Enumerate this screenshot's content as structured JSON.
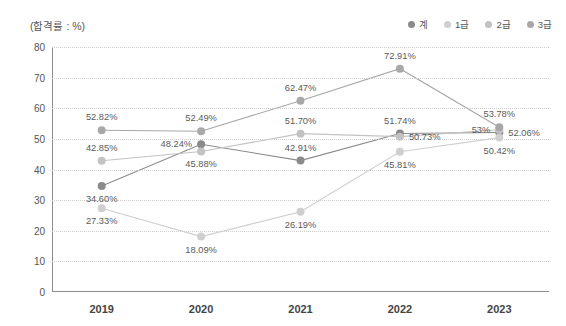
{
  "unit_label": "(합격률 : %)",
  "legend": {
    "position": "top-right",
    "items": [
      {
        "label": "계",
        "color": "#8a8a8a"
      },
      {
        "label": "1급",
        "color": "#cfcfcf"
      },
      {
        "label": "2급",
        "color": "#c2c2c2"
      },
      {
        "label": "3급",
        "color": "#a8a8a8"
      }
    ]
  },
  "chart_data": {
    "type": "line",
    "title": "",
    "subtitle": "",
    "xlabel": "",
    "ylabel": "합격률 : %",
    "categories": [
      "2019",
      "2020",
      "2021",
      "2022",
      "2023"
    ],
    "ylim": [
      0,
      80
    ],
    "yticks": [
      0,
      10,
      20,
      30,
      40,
      50,
      60,
      70,
      80
    ],
    "grid": true,
    "series": [
      {
        "name": "계",
        "color": "#8a8a8a",
        "values": [
          34.6,
          48.24,
          42.91,
          51.74,
          52.06
        ],
        "labels": [
          "34.60%",
          "48.24%",
          "42.91%",
          "51.74%",
          "52.06%"
        ],
        "label_pos": [
          "below",
          "left",
          "above",
          "above",
          "right"
        ]
      },
      {
        "name": "1급",
        "color": "#cfcfcf",
        "values": [
          27.33,
          18.09,
          26.19,
          45.81,
          50.42
        ],
        "labels": [
          "27.33%",
          "18.09%",
          "26.19%",
          "45.81%",
          "50.42%"
        ],
        "label_pos": [
          "below",
          "below",
          "below",
          "below",
          "below"
        ]
      },
      {
        "name": "2급",
        "color": "#c2c2c2",
        "values": [
          42.85,
          45.88,
          51.7,
          50.73,
          53.0
        ],
        "labels": [
          "42.85%",
          "45.88%",
          "51.70%",
          "50.73%",
          "53%"
        ],
        "label_pos": [
          "above",
          "below",
          "above",
          "right",
          "left"
        ]
      },
      {
        "name": "3급",
        "color": "#a8a8a8",
        "values": [
          52.82,
          52.49,
          62.47,
          72.91,
          53.78
        ],
        "labels": [
          "52.82%",
          "52.49%",
          "62.47%",
          "72.91%",
          "53.78%"
        ],
        "label_pos": [
          "above",
          "above",
          "above",
          "above",
          "above"
        ]
      }
    ]
  }
}
